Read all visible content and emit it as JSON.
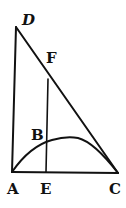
{
  "diagram": {
    "type": "geometric-figure",
    "points": {
      "D": {
        "label": "D",
        "x": 16,
        "y": 27
      },
      "F": {
        "label": "F",
        "x": 48,
        "y": 79
      },
      "B": {
        "label": "B",
        "x": 46,
        "y": 143
      },
      "A": {
        "label": "A",
        "x": 12,
        "y": 172
      },
      "E": {
        "label": "E",
        "x": 46,
        "y": 172
      },
      "C": {
        "label": "C",
        "x": 118,
        "y": 173
      }
    },
    "segments": [
      "DA",
      "AC",
      "DC",
      "FE"
    ],
    "curves": [
      "arc A-B-C"
    ],
    "colors": {
      "ink": "#111111",
      "paper": "#ffffff"
    }
  },
  "labels": {
    "d": "D",
    "f": "F",
    "b": "B",
    "a": "A",
    "e": "E",
    "c": "C"
  }
}
